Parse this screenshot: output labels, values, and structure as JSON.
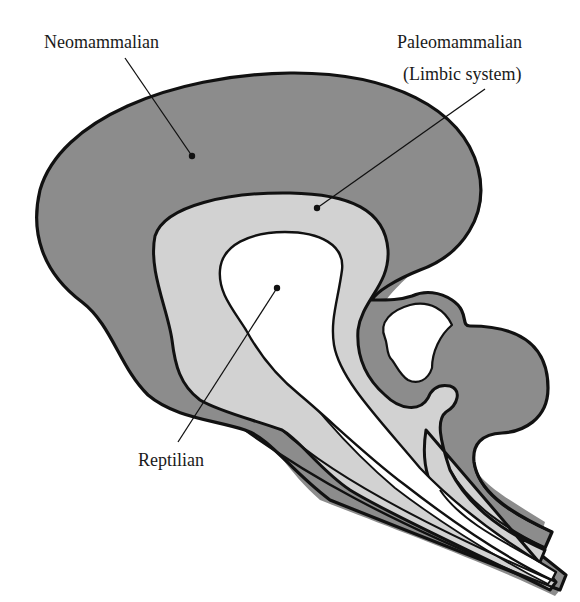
{
  "diagram": {
    "colors": {
      "neomammalian_fill": "#8c8c8c",
      "paleomammalian_fill": "#d2d2d2",
      "reptilian_fill": "#ffffff",
      "outline": "#111111",
      "background": "#ffffff"
    },
    "labels": {
      "neomammalian": "Neomammalian",
      "paleomammalian": "Paleomammalian",
      "paleomammalian_sub": "(Limbic system)",
      "reptilian": "Reptilian"
    },
    "regions": [
      {
        "id": "neomammalian",
        "label": "Neomammalian",
        "shade": "dark gray",
        "layer": "outer"
      },
      {
        "id": "paleomammalian",
        "label": "Paleomammalian (Limbic system)",
        "shade": "light gray",
        "layer": "middle"
      },
      {
        "id": "reptilian",
        "label": "Reptilian",
        "shade": "white",
        "layer": "inner"
      }
    ]
  }
}
